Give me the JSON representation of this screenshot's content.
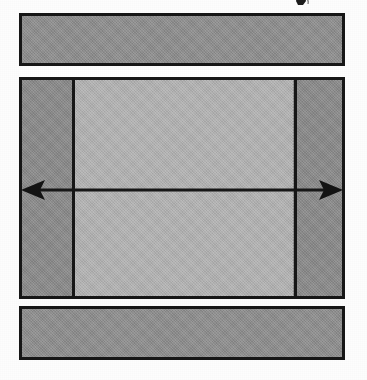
{
  "figure": {
    "caption": "",
    "background_color": "#fdfdfd",
    "line_color": "#171717",
    "canvas": {
      "width": 367,
      "height": 380
    }
  },
  "layers": [
    {
      "id": "top-bar",
      "name": "Upper layer",
      "label": "",
      "fill_color": "#909090",
      "x": 19,
      "y": 13,
      "width": 326,
      "height": 53
    },
    {
      "id": "core-bar",
      "name": "Middle layer",
      "label": "",
      "fill_color": "#8c8c8c",
      "x": 19,
      "y": 77,
      "width": 326,
      "height": 222
    },
    {
      "id": "bottom-bar",
      "name": "Lower layer",
      "label": "",
      "fill_color": "#909090",
      "x": 19,
      "y": 306,
      "width": 326,
      "height": 54
    }
  ],
  "core_regions": {
    "left_band": {
      "name": "Left edge region",
      "label": "",
      "fill_color": "#8c8c8c"
    },
    "center": {
      "name": "Central region",
      "label": "",
      "fill_color": "#b1b1b1"
    },
    "right_band": {
      "name": "Right edge region",
      "label": "",
      "fill_color": "#8c8c8c"
    }
  },
  "dividers": [
    {
      "id": "v-divider-left",
      "name": "Left vertical boundary",
      "x": 69
    },
    {
      "id": "v-divider-right",
      "name": "Right vertical boundary",
      "x": 291
    }
  ],
  "arrow": {
    "name": "Width dimension arrow",
    "style": "double-headed",
    "label": "",
    "color": "#171717",
    "y": 190,
    "x_start": 19,
    "x_end": 345
  },
  "marks": [
    {
      "id": "stray-mark",
      "name": "Stray scan artifact",
      "label": ""
    }
  ]
}
